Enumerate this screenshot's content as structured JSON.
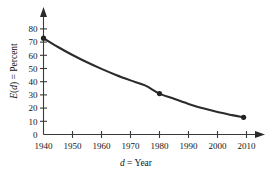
{
  "chart_data": {
    "type": "line",
    "title": "",
    "subtitle": "",
    "xlabel": "d = Year",
    "ylabel": "E(d) = Percent",
    "xlim": [
      1940,
      2014
    ],
    "ylim": [
      0,
      84
    ],
    "grid": false,
    "legend": null,
    "x_ticks": [
      1940,
      1950,
      1960,
      1970,
      1980,
      1990,
      2000,
      2010
    ],
    "x_tick_labels": [
      "1940",
      "1950",
      "1960",
      "1970",
      "1980",
      "1990",
      "2000",
      "2010"
    ],
    "y_ticks": [
      0,
      10,
      20,
      30,
      40,
      50,
      60,
      70,
      80
    ],
    "y_tick_labels": [
      "0",
      "10",
      "20",
      "30",
      "40",
      "50",
      "60",
      "70",
      "80"
    ],
    "series": [
      {
        "name": "E(d)",
        "marked_points": [
          {
            "x": 1940,
            "y": 73
          },
          {
            "x": 1980,
            "y": 31
          },
          {
            "x": 2009,
            "y": 13
          }
        ],
        "curve": [
          {
            "x": 1940,
            "y": 73.0
          },
          {
            "x": 1945,
            "y": 66.3
          },
          {
            "x": 1950,
            "y": 60.2
          },
          {
            "x": 1955,
            "y": 54.7
          },
          {
            "x": 1960,
            "y": 49.7
          },
          {
            "x": 1965,
            "y": 45.1
          },
          {
            "x": 1970,
            "y": 41.0
          },
          {
            "x": 1975,
            "y": 37.2
          },
          {
            "x": 1980,
            "y": 31.0
          },
          {
            "x": 1985,
            "y": 27.0
          },
          {
            "x": 1990,
            "y": 23.2
          },
          {
            "x": 1995,
            "y": 19.8
          },
          {
            "x": 2000,
            "y": 17.0
          },
          {
            "x": 2005,
            "y": 14.7
          },
          {
            "x": 2009,
            "y": 13.0
          }
        ]
      }
    ],
    "colors": {
      "curve": "#2b2b2b",
      "point": "#232323",
      "axis": "#3a3a3a",
      "background": "#ffffff"
    }
  },
  "labels": {
    "x_title_var": "d",
    "x_title_rest": " = Year",
    "y_title_var": "E",
    "y_title_var2": "d",
    "y_title_rest": " = Percent"
  }
}
